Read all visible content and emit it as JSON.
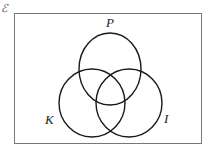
{
  "diagram": {
    "type": "venn",
    "universal_set_symbol": "ℰ",
    "sets": [
      {
        "id": "P",
        "label": "P"
      },
      {
        "id": "K",
        "label": "K"
      },
      {
        "id": "I",
        "label": "I"
      }
    ],
    "colors": {
      "stroke": "#1a1a1a",
      "frame": "#777777",
      "background": "#ffffff"
    }
  }
}
